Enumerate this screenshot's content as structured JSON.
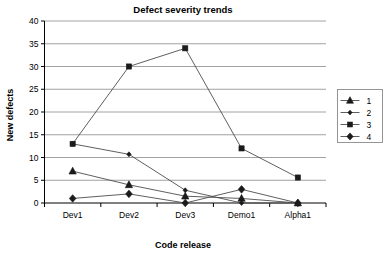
{
  "chart_data": {
    "type": "line",
    "title": "Defect severity trends",
    "xlabel": "Code release",
    "ylabel": "New defects",
    "categories": [
      "Dev1",
      "Dev2",
      "Dev3",
      "Demo1",
      "Alpha1"
    ],
    "ylim": [
      0,
      40
    ],
    "yticks": [
      0,
      5,
      10,
      15,
      20,
      25,
      30,
      35,
      40
    ],
    "ytick_labels": [
      "0",
      "5",
      "10",
      "15",
      "20",
      "25",
      "30",
      "35",
      "40"
    ],
    "grid": true,
    "legend_position": "right",
    "series": [
      {
        "name": "1",
        "marker": "triangle",
        "values": [
          7,
          4,
          1.5,
          1,
          0
        ]
      },
      {
        "name": "2",
        "marker": "small-diamond",
        "values": [
          13,
          10.7,
          2.8,
          0,
          0
        ]
      },
      {
        "name": "3",
        "marker": "square",
        "values": [
          13,
          30,
          34,
          12,
          5.6
        ]
      },
      {
        "name": "4",
        "marker": "diamond",
        "values": [
          1,
          2,
          0,
          3,
          0
        ]
      }
    ]
  },
  "legend": {
    "entries": [
      {
        "label": "1"
      },
      {
        "label": "2"
      },
      {
        "label": "3"
      },
      {
        "label": "4"
      }
    ]
  },
  "colors": {
    "line": "#4d4d4d",
    "marker": "#1a1a1a",
    "grid": "#8a8a8a",
    "axis": "#000000",
    "background": "#ffffff"
  }
}
